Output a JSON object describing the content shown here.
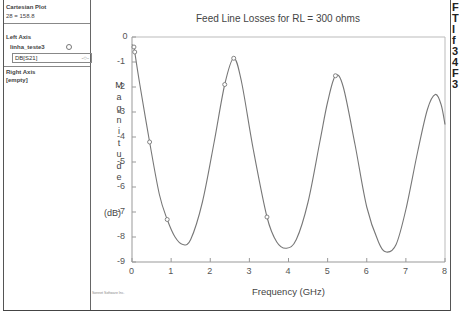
{
  "left_panel": {
    "title": "Cartesian Plot",
    "subtitle": "28 = 158.8",
    "left_axis_label": "Left Axis",
    "trace_name": "linha_teste3",
    "trace_expression": "DB[S21]",
    "right_axis_label": "Right Axis",
    "right_axis_value": "[empty]"
  },
  "right_cutoff_text": [
    "F",
    "T",
    "l",
    "f",
    "3",
    "4",
    "F",
    "3"
  ],
  "credit": "Sonnet Software Inc.",
  "chart_data": {
    "type": "line",
    "title": "Feed Line Losses for RL = 300 ohms",
    "xlabel": "Frequency (GHz)",
    "ylabel": "Magnitude (dB)",
    "xlim": [
      0,
      8
    ],
    "ylim": [
      -9,
      0
    ],
    "x_ticks": [
      "0",
      "1",
      "2",
      "3",
      "4",
      "5",
      "6",
      "7",
      "8"
    ],
    "y_ticks": [
      "0",
      "-1",
      "-2",
      "-3",
      "-4",
      "-5",
      "-6",
      "-7",
      "-8",
      "-9"
    ],
    "grid": false,
    "legend": "none",
    "series": [
      {
        "name": "DB[S21]",
        "x": [
          0.0,
          0.05,
          0.07,
          0.2,
          0.45,
          0.7,
          0.9,
          1.1,
          1.3,
          1.5,
          1.8,
          2.1,
          2.37,
          2.6,
          2.8,
          3.1,
          3.45,
          3.7,
          3.95,
          4.2,
          4.5,
          4.8,
          5.0,
          5.2,
          5.4,
          5.7,
          6.0,
          6.3,
          6.5,
          6.75,
          7.0,
          7.3,
          7.55,
          7.75,
          7.9,
          8.0
        ],
        "y": [
          -0.3,
          -0.4,
          -0.6,
          -1.9,
          -4.2,
          -6.3,
          -7.3,
          -8.0,
          -8.3,
          -8.1,
          -6.6,
          -4.2,
          -1.9,
          -0.85,
          -1.8,
          -4.5,
          -7.2,
          -8.2,
          -8.45,
          -8.1,
          -6.6,
          -4.2,
          -2.6,
          -1.55,
          -2.0,
          -4.3,
          -6.8,
          -8.2,
          -8.6,
          -8.3,
          -6.9,
          -4.6,
          -2.9,
          -2.3,
          -2.7,
          -3.5
        ]
      }
    ],
    "markers": [
      {
        "x": 0.05,
        "y": -0.4
      },
      {
        "x": 0.07,
        "y": -0.6
      },
      {
        "x": 0.45,
        "y": -4.2
      },
      {
        "x": 0.9,
        "y": -7.3
      },
      {
        "x": 2.37,
        "y": -1.9
      },
      {
        "x": 2.6,
        "y": -0.85
      },
      {
        "x": 3.45,
        "y": -7.2
      },
      {
        "x": 5.2,
        "y": -1.55
      }
    ]
  },
  "colors": {
    "curve": "#777777",
    "axis": "#999999",
    "frame": "#bbbbbb"
  }
}
